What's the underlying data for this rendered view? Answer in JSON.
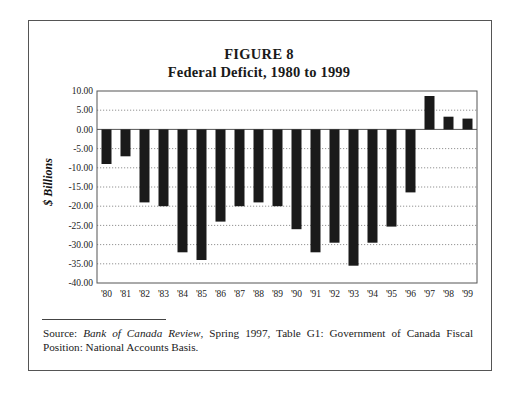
{
  "figure": {
    "label": "FIGURE 8",
    "title": "Federal Deficit, 1980 to 1999"
  },
  "source": {
    "prefix": "Source: ",
    "publication": "Bank of Canada Review",
    "rest": ", Spring 1997, Table G1: Government of Canada Fiscal Position: National Accounts Basis."
  },
  "colors": {
    "bar": "#1a1a1a",
    "gridline": "#777777",
    "axis": "#555555"
  },
  "chart_data": {
    "type": "bar",
    "xlabel": "",
    "ylabel": "$ Billions",
    "categories": [
      "'80",
      "'81",
      "'82",
      "'83",
      "'84",
      "'85",
      "'86",
      "'87",
      "'88",
      "'89",
      "'90",
      "'91",
      "'92",
      "'93",
      "'94",
      "'95",
      "'96",
      "'97",
      "'98",
      "'99"
    ],
    "values": [
      -9,
      -7,
      -19,
      -20,
      -32,
      -34,
      -24,
      -20,
      -19,
      -20,
      -26,
      -32,
      -29.5,
      -35.5,
      -29.5,
      -25.3,
      -16.4,
      8.7,
      3.3,
      2.8
    ],
    "ylim": [
      -40,
      10
    ],
    "yticks": [
      "10.00",
      "5.00",
      "0.00",
      "-5.00",
      "-10.00",
      "-15.00",
      "-20.00",
      "-25.00",
      "-30.00",
      "-35.00",
      "-40.00"
    ],
    "ytick_values": [
      10,
      5,
      0,
      -5,
      -10,
      -15,
      -20,
      -25,
      -30,
      -35,
      -40
    ],
    "grid": "horizontal dotted",
    "legend": null
  }
}
